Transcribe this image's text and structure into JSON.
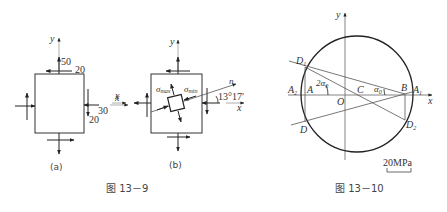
{
  "figure_13_9": {
    "caption": "图 13－9",
    "panel_a": {
      "label": "(a)",
      "axis_x": "x",
      "axis_y": "y",
      "values": {
        "top_normal": "50",
        "top_shear": "20",
        "right_normal": "30",
        "right_shear": "20"
      }
    },
    "panel_b": {
      "label": "(b)",
      "axis_x": "x",
      "axis_y": "y",
      "axis_n": "n",
      "sigma_max": "σmax",
      "sigma_min": "σmin",
      "sigma_max_base": "σ",
      "sigma_max_sub": "max",
      "sigma_min_base": "σ",
      "sigma_min_sub": "min",
      "angle": "13°17′"
    }
  },
  "figure_13_10": {
    "caption": "图 13－10",
    "axis_x": "x",
    "axis_y": "y",
    "points": {
      "D1": "D",
      "D1_sub": "1",
      "D2": "D",
      "D2_sub": "2",
      "D": "D",
      "A": "A",
      "A1": "A",
      "A1_sub": "1",
      "A2": "A",
      "A2_sub": "2",
      "B": "B",
      "C": "C",
      "O": "O"
    },
    "angle_2a0": "2α",
    "angle_2a0_sub": "0",
    "angle_a0": "α",
    "angle_a0_sub": "0",
    "scale_bar": "20MPa"
  }
}
